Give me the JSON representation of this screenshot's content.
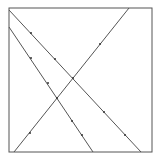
{
  "diagram": {
    "frame": {
      "x": 9,
      "y": 8,
      "width": 143,
      "height": 144,
      "stroke": "#555555"
    },
    "lines": [
      {
        "name": "line-a",
        "x1": 9,
        "y1": 10,
        "x2": 141,
        "y2": 152,
        "dots": [
          [
            31,
            33
          ],
          [
            55,
            59
          ],
          [
            104,
            112
          ],
          [
            125,
            135
          ]
        ]
      },
      {
        "name": "line-b",
        "x1": 9,
        "y1": 27,
        "x2": 93,
        "y2": 152,
        "dots": [
          [
            31,
            58
          ],
          [
            48,
            83
          ],
          [
            72,
            121
          ],
          [
            82,
            135
          ]
        ]
      },
      {
        "name": "line-c",
        "x1": 14,
        "y1": 152,
        "x2": 129,
        "y2": 8,
        "dots": [
          [
            30,
            133
          ],
          [
            100,
            44
          ]
        ]
      }
    ],
    "intersections": [
      [
        73,
        78
      ],
      [
        57,
        98
      ]
    ],
    "line_color": "#555555"
  }
}
